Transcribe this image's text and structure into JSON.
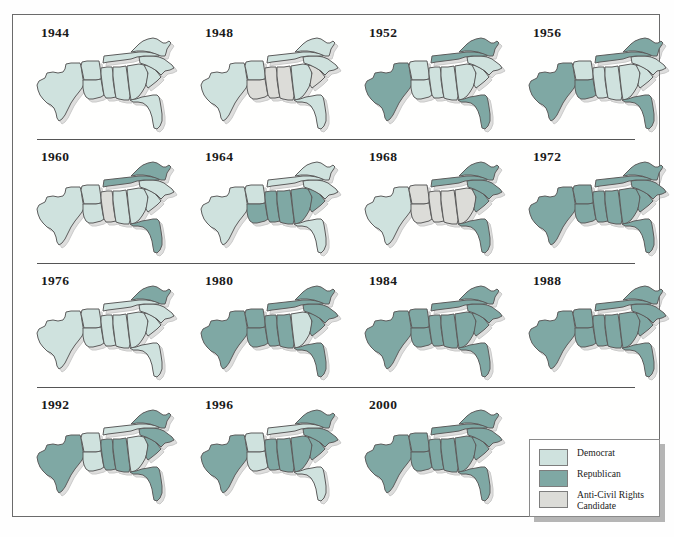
{
  "figure": {
    "colors": {
      "democrat": "#cfe2de",
      "republican": "#7fa8a4",
      "anticivil": "#dcdcd8",
      "outline": "#5c5c5c",
      "frame": "#6b6b6b",
      "rule": "#555555",
      "text": "#1a1a1a"
    }
  },
  "legend": {
    "items": [
      {
        "key": "democrat",
        "label": "Democrat",
        "color": "#cfe2de"
      },
      {
        "key": "republican",
        "label": "Republican",
        "color": "#7fa8a4"
      },
      {
        "key": "anticivil",
        "label": "Anti-Civil Rights Candidate",
        "color": "#dcdcd8"
      }
    ]
  },
  "states_order": [
    "TX",
    "AR",
    "LA",
    "MS",
    "AL",
    "GA",
    "FL",
    "SC",
    "NC",
    "TN",
    "VA"
  ],
  "chart_data": {
    "type": "map",
    "categories": [
      "TX",
      "AR",
      "LA",
      "MS",
      "AL",
      "GA",
      "FL",
      "SC",
      "NC",
      "TN",
      "VA"
    ],
    "legend": [
      "Democrat",
      "Republican",
      "Anti-Civil Rights Candidate"
    ],
    "series": [
      {
        "name": "1944",
        "values": {
          "TX": "democrat",
          "AR": "democrat",
          "LA": "democrat",
          "MS": "democrat",
          "AL": "democrat",
          "GA": "democrat",
          "FL": "democrat",
          "SC": "democrat",
          "NC": "democrat",
          "TN": "democrat",
          "VA": "democrat"
        }
      },
      {
        "name": "1948",
        "values": {
          "TX": "democrat",
          "AR": "democrat",
          "LA": "anticivil",
          "MS": "anticivil",
          "AL": "anticivil",
          "GA": "democrat",
          "FL": "democrat",
          "SC": "anticivil",
          "NC": "democrat",
          "TN": "democrat",
          "VA": "democrat"
        }
      },
      {
        "name": "1952",
        "values": {
          "TX": "republican",
          "AR": "democrat",
          "LA": "democrat",
          "MS": "democrat",
          "AL": "democrat",
          "GA": "democrat",
          "FL": "republican",
          "SC": "democrat",
          "NC": "democrat",
          "TN": "republican",
          "VA": "republican"
        }
      },
      {
        "name": "1956",
        "values": {
          "TX": "republican",
          "AR": "democrat",
          "LA": "republican",
          "MS": "democrat",
          "AL": "democrat",
          "GA": "democrat",
          "FL": "republican",
          "SC": "democrat",
          "NC": "democrat",
          "TN": "republican",
          "VA": "republican"
        }
      },
      {
        "name": "1960",
        "values": {
          "TX": "democrat",
          "AR": "democrat",
          "LA": "democrat",
          "MS": "anticivil",
          "AL": "democrat",
          "GA": "democrat",
          "FL": "republican",
          "SC": "democrat",
          "NC": "democrat",
          "TN": "republican",
          "VA": "republican"
        }
      },
      {
        "name": "1964",
        "values": {
          "TX": "democrat",
          "AR": "democrat",
          "LA": "republican",
          "MS": "republican",
          "AL": "republican",
          "GA": "republican",
          "FL": "democrat",
          "SC": "republican",
          "NC": "democrat",
          "TN": "democrat",
          "VA": "democrat"
        }
      },
      {
        "name": "1968",
        "values": {
          "TX": "democrat",
          "AR": "anticivil",
          "LA": "anticivil",
          "MS": "anticivil",
          "AL": "anticivil",
          "GA": "anticivil",
          "FL": "republican",
          "SC": "republican",
          "NC": "republican",
          "TN": "republican",
          "VA": "republican"
        }
      },
      {
        "name": "1972",
        "values": {
          "TX": "republican",
          "AR": "republican",
          "LA": "republican",
          "MS": "republican",
          "AL": "republican",
          "GA": "republican",
          "FL": "republican",
          "SC": "republican",
          "NC": "republican",
          "TN": "republican",
          "VA": "republican"
        }
      },
      {
        "name": "1976",
        "values": {
          "TX": "democrat",
          "AR": "democrat",
          "LA": "democrat",
          "MS": "democrat",
          "AL": "democrat",
          "GA": "democrat",
          "FL": "democrat",
          "SC": "democrat",
          "NC": "democrat",
          "TN": "democrat",
          "VA": "republican"
        }
      },
      {
        "name": "1980",
        "values": {
          "TX": "republican",
          "AR": "republican",
          "LA": "republican",
          "MS": "republican",
          "AL": "republican",
          "GA": "democrat",
          "FL": "republican",
          "SC": "republican",
          "NC": "republican",
          "TN": "republican",
          "VA": "republican"
        }
      },
      {
        "name": "1984",
        "values": {
          "TX": "republican",
          "AR": "republican",
          "LA": "republican",
          "MS": "republican",
          "AL": "republican",
          "GA": "republican",
          "FL": "republican",
          "SC": "republican",
          "NC": "republican",
          "TN": "republican",
          "VA": "republican"
        }
      },
      {
        "name": "1988",
        "values": {
          "TX": "republican",
          "AR": "republican",
          "LA": "republican",
          "MS": "republican",
          "AL": "republican",
          "GA": "republican",
          "FL": "republican",
          "SC": "republican",
          "NC": "republican",
          "TN": "republican",
          "VA": "republican"
        }
      },
      {
        "name": "1992",
        "values": {
          "TX": "republican",
          "AR": "democrat",
          "LA": "democrat",
          "MS": "republican",
          "AL": "republican",
          "GA": "democrat",
          "FL": "republican",
          "SC": "republican",
          "NC": "republican",
          "TN": "democrat",
          "VA": "republican"
        }
      },
      {
        "name": "1996",
        "values": {
          "TX": "republican",
          "AR": "democrat",
          "LA": "democrat",
          "MS": "republican",
          "AL": "republican",
          "GA": "republican",
          "FL": "democrat",
          "SC": "republican",
          "NC": "republican",
          "TN": "democrat",
          "VA": "republican"
        }
      },
      {
        "name": "2000",
        "values": {
          "TX": "republican",
          "AR": "republican",
          "LA": "republican",
          "MS": "republican",
          "AL": "republican",
          "GA": "republican",
          "FL": "republican",
          "SC": "republican",
          "NC": "republican",
          "TN": "republican",
          "VA": "republican"
        }
      }
    ]
  },
  "maps": [
    {
      "year": "1944"
    },
    {
      "year": "1948"
    },
    {
      "year": "1952"
    },
    {
      "year": "1956"
    },
    {
      "year": "1960"
    },
    {
      "year": "1964"
    },
    {
      "year": "1968"
    },
    {
      "year": "1972"
    },
    {
      "year": "1976"
    },
    {
      "year": "1980"
    },
    {
      "year": "1984"
    },
    {
      "year": "1988"
    },
    {
      "year": "1992"
    },
    {
      "year": "1996"
    },
    {
      "year": "2000"
    }
  ]
}
